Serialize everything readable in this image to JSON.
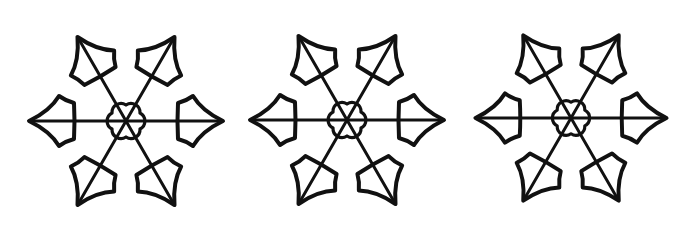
{
  "illustration": {
    "description": "Three hand-drawn black-ink snowflakes on white, each with six holly-leaf shaped arms and a six-petal flower center",
    "background_color": "#ffffff",
    "ink_color": "#111111",
    "snowflakes": [
      {
        "id": "snowflake-1",
        "cx": 126,
        "cy": 121,
        "radius": 98,
        "rotation": 0,
        "arms": 6,
        "center_petals": 6
      },
      {
        "id": "snowflake-2",
        "cx": 347,
        "cy": 120,
        "radius": 97,
        "rotation": 0,
        "arms": 6,
        "center_petals": 6
      },
      {
        "id": "snowflake-3",
        "cx": 571,
        "cy": 118,
        "radius": 96,
        "rotation": 0,
        "arms": 6,
        "center_petals": 6
      }
    ]
  }
}
